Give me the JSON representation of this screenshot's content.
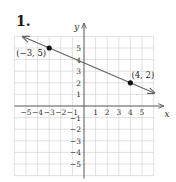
{
  "problem": {
    "number": "1."
  },
  "chart_data": {
    "type": "line",
    "title": "",
    "xlabel": "x",
    "ylabel": "y",
    "xlim": [
      -6,
      6
    ],
    "ylim": [
      -6,
      6
    ],
    "grid": true,
    "x_ticks": [
      -5,
      -4,
      -3,
      -2,
      -1,
      1,
      2,
      3,
      4,
      5
    ],
    "y_ticks": [
      -5,
      -4,
      -3,
      -2,
      -1,
      1,
      2,
      3,
      4,
      5
    ],
    "x_tick_labels": [
      "−5",
      "−4",
      "−3",
      "−2",
      "−1",
      "1",
      "2",
      "3",
      "4",
      "5"
    ],
    "y_tick_labels": [
      "−5",
      "−4",
      "−3",
      "−2",
      "−1",
      "1",
      "2",
      "3",
      "4",
      "5"
    ],
    "series": [
      {
        "name": "line through (−3, 5) and (4, 2)",
        "slope": -0.4286,
        "intercept": 3.714,
        "x": [
          -5.3,
          6.1
        ],
        "y": [
          5.99,
          1.1
        ],
        "arrows": "both"
      }
    ],
    "points": [
      {
        "x": -3,
        "y": 5,
        "label": "(−3, 5)"
      },
      {
        "x": 4,
        "y": 2,
        "label": "(4, 2)"
      }
    ]
  },
  "colors": {
    "grid": "#d4d4d4",
    "axis": "#555555",
    "line": "#666666",
    "point": "#111111"
  }
}
